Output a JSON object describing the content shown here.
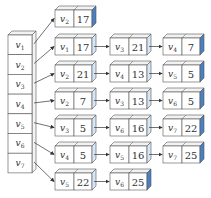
{
  "colors": {
    "stroke": "#555555",
    "face": "#ffffff",
    "top": "#f2f2f2",
    "side_light": "#d6e6f5",
    "side_dark": "#4a7fc1",
    "arrow": "#333333"
  },
  "vertex_array": [
    "v1",
    "v2",
    "v3",
    "v4",
    "v5",
    "v6",
    "v7"
  ],
  "adjacency_lists": [
    {
      "head": "v1",
      "nodes": [
        {
          "v": "v2",
          "w": "17"
        }
      ]
    },
    {
      "head": "v2",
      "nodes": [
        {
          "v": "v1",
          "w": "17"
        },
        {
          "v": "v3",
          "w": "21"
        },
        {
          "v": "v4",
          "w": "7"
        }
      ]
    },
    {
      "head": "v3",
      "nodes": [
        {
          "v": "v2",
          "w": "21"
        },
        {
          "v": "v4",
          "w": "13"
        },
        {
          "v": "v5",
          "w": "5"
        }
      ]
    },
    {
      "head": "v4",
      "nodes": [
        {
          "v": "v2",
          "w": "7"
        },
        {
          "v": "v3",
          "w": "13"
        },
        {
          "v": "v6",
          "w": "5"
        }
      ]
    },
    {
      "head": "v5",
      "nodes": [
        {
          "v": "v3",
          "w": "5"
        },
        {
          "v": "v6",
          "w": "16"
        },
        {
          "v": "v7",
          "w": "22"
        }
      ]
    },
    {
      "head": "v6",
      "nodes": [
        {
          "v": "v4",
          "w": "5"
        },
        {
          "v": "v5",
          "w": "16"
        },
        {
          "v": "v7",
          "w": "25"
        }
      ]
    },
    {
      "head": "v7",
      "nodes": [
        {
          "v": "v5",
          "w": "22"
        },
        {
          "v": "v6",
          "w": "25"
        }
      ]
    }
  ]
}
